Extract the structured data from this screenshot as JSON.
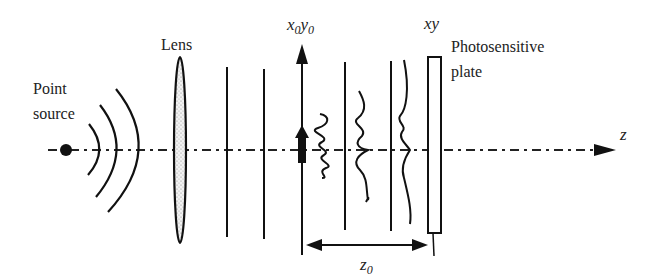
{
  "diagram": {
    "labels": {
      "point_source_line1": "Point",
      "point_source_line2": "source",
      "lens": "Lens",
      "object_plane": "x₀y₀",
      "object_plane_x": "x",
      "object_plane_x_sub": "0",
      "object_plane_y": "y",
      "object_plane_y_sub": "0",
      "image_plane": "xy",
      "plate_line1": "Photosensitive",
      "plate_line2": "plate",
      "axis": "z",
      "distance": "z",
      "distance_sub": "0"
    },
    "colors": {
      "stroke": "#111111",
      "lens_fill": "#e6e6e6",
      "background": "#ffffff"
    }
  }
}
